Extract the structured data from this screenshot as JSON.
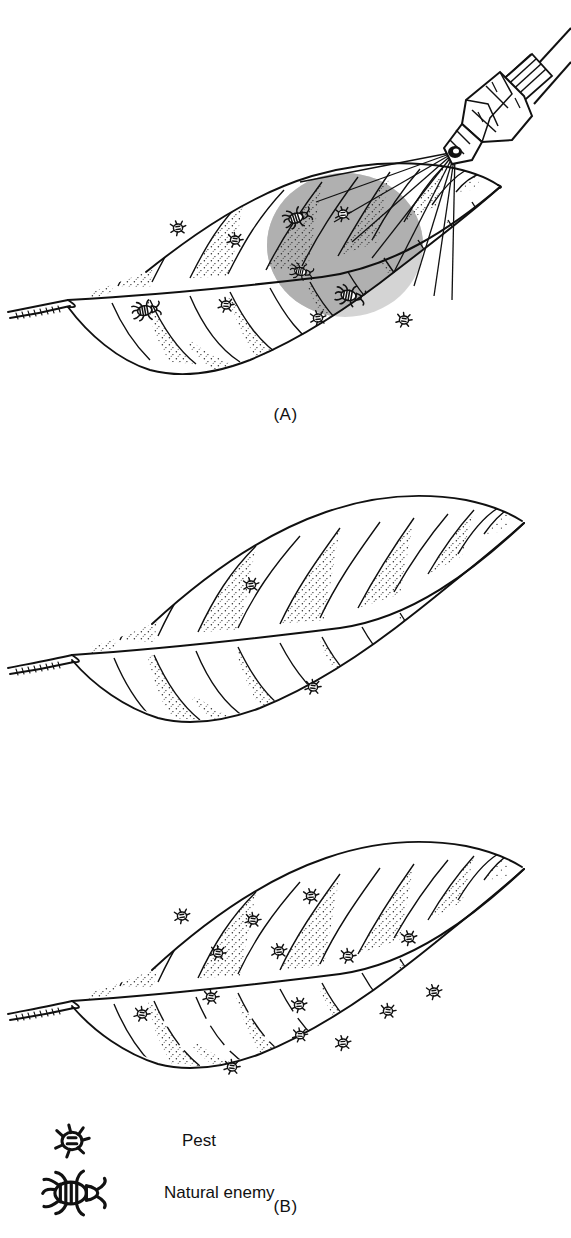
{
  "figure": {
    "background_color": "#ffffff",
    "ink_color": "#111111",
    "spray_zone_color": "#b0b0b0",
    "stipple_color": "#222222"
  },
  "panels": [
    {
      "id": "A",
      "label": "(A)",
      "caption_text": "(A)",
      "description": "Leaf being sprayed by a nozzle; pests and natural enemies present, spray cloud covers right portion of leaf",
      "has_sprayer": true,
      "has_spray_zone": true,
      "pest_count": 6,
      "natural_enemy_count": 4,
      "pests": [
        {
          "x": 178,
          "y": 228,
          "scale": 1.0,
          "rot": -8
        },
        {
          "x": 235,
          "y": 240,
          "scale": 1.0,
          "rot": 6
        },
        {
          "x": 343,
          "y": 214,
          "scale": 1.0,
          "rot": -4
        },
        {
          "x": 226,
          "y": 305,
          "scale": 1.0,
          "rot": 4
        },
        {
          "x": 318,
          "y": 318,
          "scale": 1.0,
          "rot": -6
        },
        {
          "x": 404,
          "y": 320,
          "scale": 1.0,
          "rot": 8
        }
      ],
      "natural_enemies": [
        {
          "x": 299,
          "y": 217,
          "scale": 1.05,
          "rot": -18
        },
        {
          "x": 303,
          "y": 272,
          "scale": 0.85,
          "rot": 12
        },
        {
          "x": 148,
          "y": 310,
          "scale": 1.05,
          "rot": -10
        },
        {
          "x": 352,
          "y": 296,
          "scale": 1.1,
          "rot": 10
        }
      ],
      "spray_zone": {
        "cx": 345,
        "cy": 245,
        "rx": 78,
        "ry": 72
      }
    },
    {
      "id": "B",
      "label": "(B)",
      "caption_text": "(B)",
      "description": "Leaf after spraying; almost all insects eliminated, only two pests survive",
      "has_sprayer": false,
      "has_spray_zone": false,
      "pest_count": 2,
      "natural_enemy_count": 0,
      "pests": [
        {
          "x": 251,
          "y": 585,
          "scale": 1.0,
          "rot": -6
        },
        {
          "x": 313,
          "y": 687,
          "scale": 1.0,
          "rot": 6
        }
      ],
      "natural_enemies": []
    },
    {
      "id": "C",
      "label": "(C)",
      "caption_text": "(C)",
      "description": "Pest resurgence; pest population explodes in absence of natural enemies",
      "has_sprayer": false,
      "has_spray_zone": false,
      "pest_count": 15,
      "natural_enemy_count": 0,
      "pests": [
        {
          "x": 182,
          "y": 916,
          "scale": 1.0,
          "rot": -8
        },
        {
          "x": 253,
          "y": 920,
          "scale": 1.0,
          "rot": 5
        },
        {
          "x": 311,
          "y": 896,
          "scale": 1.0,
          "rot": -5
        },
        {
          "x": 218,
          "y": 953,
          "scale": 1.0,
          "rot": 7
        },
        {
          "x": 279,
          "y": 951,
          "scale": 1.0,
          "rot": -6
        },
        {
          "x": 348,
          "y": 956,
          "scale": 1.0,
          "rot": 4
        },
        {
          "x": 409,
          "y": 938,
          "scale": 1.0,
          "rot": -7
        },
        {
          "x": 211,
          "y": 997,
          "scale": 1.0,
          "rot": 6
        },
        {
          "x": 299,
          "y": 1005,
          "scale": 1.0,
          "rot": -5
        },
        {
          "x": 388,
          "y": 1011,
          "scale": 1.0,
          "rot": 5
        },
        {
          "x": 434,
          "y": 992,
          "scale": 1.0,
          "rot": -6
        },
        {
          "x": 142,
          "y": 1014,
          "scale": 1.0,
          "rot": 7
        },
        {
          "x": 343,
          "y": 1043,
          "scale": 1.0,
          "rot": -4
        },
        {
          "x": 232,
          "y": 1067,
          "scale": 1.0,
          "rot": 6
        },
        {
          "x": 300,
          "y": 1035,
          "scale": 0.95,
          "rot": 3
        }
      ],
      "natural_enemies": []
    }
  ],
  "legend": {
    "items": [
      {
        "icon": "pest-icon",
        "label": "Pest"
      },
      {
        "icon": "natural-enemy-icon",
        "label": "Natural enemy"
      }
    ]
  },
  "sprayer": {
    "name": "spray-nozzle",
    "description": "Hydraulic spray nozzle with hex body, threaded collar and two supply lines emitting a fan of spray",
    "tip_x": 455,
    "tip_y": 152,
    "fan_rays": 9
  }
}
